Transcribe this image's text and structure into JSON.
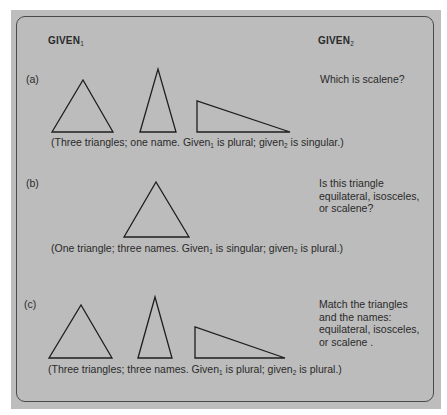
{
  "header": {
    "given1_label": "GIVEN",
    "given1_sub": "1",
    "given2_label": "GIVEN",
    "given2_sub": "2"
  },
  "sections": [
    {
      "label": "(a)",
      "question_lines": [
        "Which is scalene?"
      ],
      "caption_pre": "(Three triangles; one name. Given",
      "caption_sub1": "1",
      "caption_mid": " is plural; given",
      "caption_sub2": "2",
      "caption_post": " is singular.)",
      "triangles": [
        "equilateral",
        "isosceles",
        "right-scalene"
      ]
    },
    {
      "label": "(b)",
      "question_lines": [
        "Is this triangle",
        "equilateral, isosceles,",
        "or scalene?"
      ],
      "caption_pre": "(One triangle; three names. Given",
      "caption_sub1": "1",
      "caption_mid": " is singular; given",
      "caption_sub2": "2",
      "caption_post": " is plural.)",
      "triangles": [
        "equilateral"
      ]
    },
    {
      "label": "(c)",
      "question_lines": [
        "Match the triangles",
        "and the names:",
        "equilateral, isosceles,",
        "or scalene ."
      ],
      "caption_pre": "(Three triangles; three names. Given",
      "caption_sub1": "1",
      "caption_mid": " is plural; given",
      "caption_sub2": "2",
      "caption_post": " is plural.)",
      "triangles": [
        "equilateral",
        "isosceles",
        "right-scalene"
      ]
    }
  ],
  "colors": {
    "panel": "#bdbdbd",
    "border": "#4a4a4a",
    "ink": "#1e1e1e"
  }
}
